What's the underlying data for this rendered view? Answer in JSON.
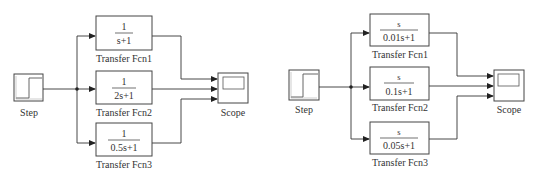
{
  "diagrams": [
    {
      "step_label": "Step",
      "scope_label": "Scope",
      "blocks": [
        {
          "numerator": "1",
          "denominator": "s+1",
          "label": "Transfer Fcn1"
        },
        {
          "numerator": "1",
          "denominator": "2s+1",
          "label": "Transfer Fcn2"
        },
        {
          "numerator": "1",
          "denominator": "0.5s+1",
          "label": "Transfer Fcn3"
        }
      ]
    },
    {
      "step_label": "Step",
      "scope_label": "Scope",
      "blocks": [
        {
          "numerator": "s",
          "denominator": "0.01s+1",
          "label": "Transfer Fcn1"
        },
        {
          "numerator": "s",
          "denominator": "0.1s+1",
          "label": "Transfer Fcn2"
        },
        {
          "numerator": "s",
          "denominator": "0.05s+1",
          "label": "Transfer Fcn3"
        }
      ]
    }
  ]
}
